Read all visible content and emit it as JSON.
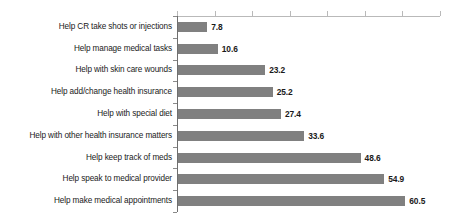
{
  "chart_data": {
    "type": "bar",
    "orientation": "horizontal",
    "title": "",
    "subtitle": "",
    "xlabel": "",
    "ylabel": "",
    "categories": [
      "Help CR take shots or injections",
      "Help manage medical tasks",
      "Help with skin care wounds",
      "Help add/change health insurance",
      "Help with special diet",
      "Help with other health insurance matters",
      "Help keep track of meds",
      "Help speak to medical provider",
      "Help make medical appointments"
    ],
    "values": [
      7.8,
      10.6,
      23.2,
      25.2,
      27.4,
      33.6,
      48.6,
      54.9,
      60.5
    ],
    "value_labels": [
      "7.8",
      "10.6",
      "23.2",
      "25.2",
      "27.4",
      "33.6",
      "48.6",
      "54.9",
      "60.5"
    ],
    "xlim": [
      0,
      70
    ],
    "tick_values": [
      0,
      10,
      20,
      30,
      40,
      50,
      60,
      70
    ],
    "tick_labels": [
      "",
      "",
      "",
      "",
      "",
      "",
      "",
      ""
    ],
    "grid": false,
    "legend": false,
    "legend_position": "none",
    "bar_color": "#808080",
    "text_color": "#1a1a1a",
    "axis_color": "#6f6f6f",
    "background_color": "#ffffff"
  }
}
